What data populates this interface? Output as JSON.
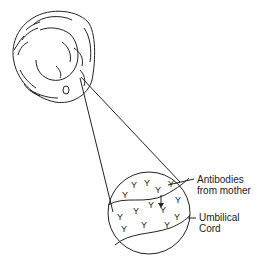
{
  "diagram": {
    "labels": {
      "antibodies_line1": "Antibodies",
      "antibodies_line2": "from mother",
      "cord_line1": "Umbilical",
      "cord_line2": "Cord"
    },
    "colors": {
      "line": "#222222",
      "background": "#ffffff"
    }
  }
}
